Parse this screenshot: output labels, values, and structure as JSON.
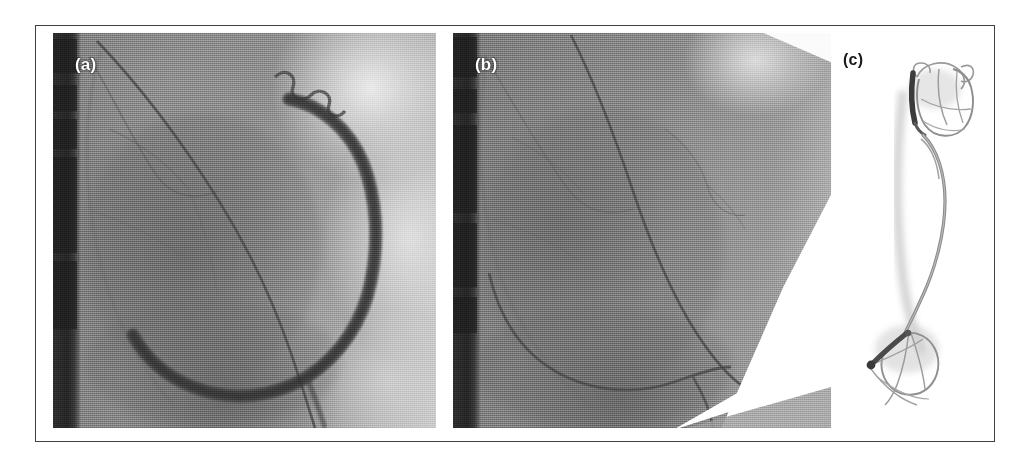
{
  "figure": {
    "caption_labels": {
      "a": "(a)",
      "b": "(b)",
      "c": "(c)"
    },
    "frame": {
      "border_color": "#404040",
      "background": "#ffffff"
    }
  },
  "panels": [
    {
      "id": "a",
      "label": "(a)",
      "type": "coronary-angiogram",
      "description": "Fluoroscopic coronary angiogram showing a contrast-opacified C-shaped right coronary artery with a guidewire in place",
      "label_color": "#ffffff",
      "background_color": "#8b8b8b",
      "features": {
        "dark_left_strip": "#2a2a2a",
        "contrast_vessel": "#4a4a4a",
        "guidewire": "#5a5a5a",
        "bright_field": "#e2e2e2"
      }
    },
    {
      "id": "b",
      "label": "(b)",
      "type": "coronary-angiogram",
      "description": "Post-procedure fluoroscopic image of the same projection; contrast has cleared leaving only the thin guidewire, with a white collimator wedge at lower right",
      "label_color": "#ffffff",
      "background_color": "#8a8a8a",
      "features": {
        "dark_left_strip": "#2a2a2a",
        "guidewire": "#5e5e5e",
        "collimator_wedge": "#ffffff"
      }
    },
    {
      "id": "c",
      "label": "(c)",
      "type": "device-photograph",
      "description": "Photograph of the retrieved wire device: two expandable basket cages joined by a long curved shaft, each cage fitted with a dark radiopaque marker band",
      "label_color": "#1a1a1a",
      "background_color": "#ffffff",
      "features": {
        "upper_basket": "rounded wire cage",
        "lower_basket": "fan-shaped wire cage",
        "shaft": "long curved wire",
        "marker_band": "#3a3a3a"
      }
    }
  ]
}
